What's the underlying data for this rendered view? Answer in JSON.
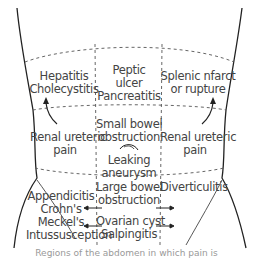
{
  "diagram": {
    "regions": {
      "right_upper": [
        "Hepatitis",
        "Cholecystitis"
      ],
      "epigastric": [
        "Peptic",
        "ulcer",
        "Pancreatitis"
      ],
      "left_upper": [
        "Splenic nfarct",
        "or rupture"
      ],
      "right_flank": [
        "Renal ureteric",
        "pain"
      ],
      "umbilical": [
        "Small bowel",
        "obstruction"
      ],
      "umbilical_lower": [
        "Leaking",
        "aneurysm"
      ],
      "left_flank": [
        "Renal ureteric",
        "pain"
      ],
      "right_iliac": [
        "Appendicitis",
        "Crohn's",
        "Meckel's",
        "Intussusception"
      ],
      "suprapubic_upper": [
        "Large bowel",
        "obstruction"
      ],
      "suprapubic_lower": [
        "Ovarian cyst",
        "Salpingitis"
      ],
      "left_iliac": [
        "Diverticulitis"
      ]
    },
    "icons": {
      "aneurysm_symbol": "arc-icon",
      "flank_arrows": "curved-arrow-icon",
      "iliac_arrows": "double-arrow-icon"
    },
    "colors": {
      "line": "#222222",
      "dash": "#555555",
      "text": "#444444"
    },
    "caption": "Regions of the abdomen in which pain is"
  }
}
